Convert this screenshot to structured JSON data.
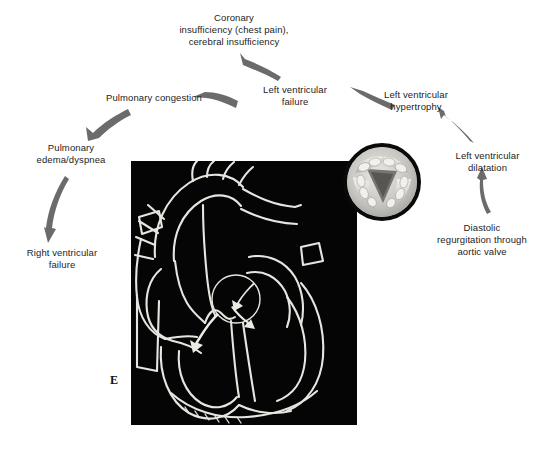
{
  "figure": {
    "panel_letter": "E",
    "heart_image_alt": "heart-line-drawing",
    "inset_alt": "aortic-valve-photo-inset"
  },
  "cycle": {
    "nodes": [
      {
        "id": "coronary-insufficiency",
        "label": "Coronary\ninsufficiency (chest pain),\ncerebral insufficiency",
        "x": 144,
        "y": 12,
        "width": 180
      },
      {
        "id": "left-ventricular-failure",
        "label": "Left ventricular\nfailure",
        "x": 243,
        "y": 84,
        "width": 104
      },
      {
        "id": "pulmonary-congestion",
        "label": "Pulmonary congestion",
        "x": 97,
        "y": 92,
        "width": 114
      },
      {
        "id": "pulmonary-edema-dyspnea",
        "label": "Pulmonary\nedema/dyspnea",
        "x": 23,
        "y": 142,
        "width": 96
      },
      {
        "id": "right-ventricular-failure",
        "label": "Right ventricular\nfailure",
        "x": 10,
        "y": 247,
        "width": 104
      },
      {
        "id": "left-ventricular-hypertrophy",
        "label": "Left ventricular\nhypertrophy",
        "x": 364,
        "y": 89,
        "width": 104
      },
      {
        "id": "left-ventricular-dilatation",
        "label": "Left ventricular\ndilatation",
        "x": 439,
        "y": 150,
        "width": 97
      },
      {
        "id": "diastolic-regurgitation",
        "label": "Diastolic\nregurgitation through\naortic valve",
        "x": 428,
        "y": 222,
        "width": 108
      }
    ],
    "arrows": [
      {
        "id": "arrow-lvf-to-coronary",
        "from": "left-ventricular-failure",
        "to": "coronary-insufficiency"
      },
      {
        "id": "arrow-lvf-to-pulmonary-congestion",
        "from": "left-ventricular-failure",
        "to": "pulmonary-congestion"
      },
      {
        "id": "arrow-pulmonary-congestion-to-edema",
        "from": "pulmonary-congestion",
        "to": "pulmonary-edema-dyspnea"
      },
      {
        "id": "arrow-edema-to-rvf",
        "from": "pulmonary-edema-dyspnea",
        "to": "right-ventricular-failure"
      },
      {
        "id": "arrow-lvh-to-lvf",
        "from": "left-ventricular-hypertrophy",
        "to": "left-ventricular-failure"
      },
      {
        "id": "arrow-dilatation-to-lvh",
        "from": "left-ventricular-dilatation",
        "to": "left-ventricular-hypertrophy"
      },
      {
        "id": "arrow-regurgitation-to-dilatation",
        "from": "diastolic-regurgitation",
        "to": "left-ventricular-dilatation"
      }
    ]
  },
  "colors": {
    "background": "#ffffff",
    "text": "#1d1d1d",
    "arrow": "#636363",
    "figure_background": "#050505",
    "figure_line": "#e8e8e4",
    "inset_border": "#0a0a0a"
  }
}
